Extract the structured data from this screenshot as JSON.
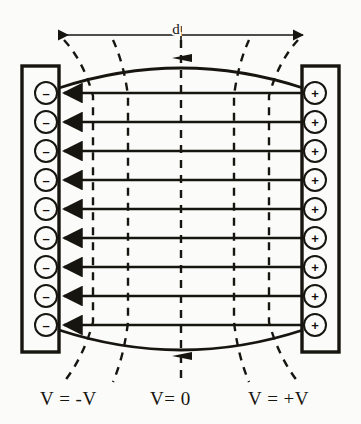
{
  "figure": {
    "background_color": "#fbfbf9",
    "ink_color": "#17150f"
  },
  "dimension": {
    "label": "d",
    "style": "double-headed-arrow",
    "x_start": 57,
    "x_end": 305,
    "y": 35,
    "label_x": 181,
    "label_y": 30
  },
  "plates": {
    "left": {
      "name": "negative-plate",
      "charge_symbol": "–",
      "charge_count": 9,
      "x": 22,
      "y": 66,
      "width": 37,
      "height": 286,
      "potential_label": "V = -V"
    },
    "right": {
      "name": "positive-plate",
      "charge_symbol": "+",
      "charge_count": 9,
      "x": 302,
      "y": 66,
      "width": 37,
      "height": 286,
      "potential_label": "V = +V"
    }
  },
  "field_lines": {
    "count": 9,
    "direction": "right-to-left",
    "x_start": 303,
    "x_end": 58,
    "y_values": [
      93,
      122,
      151,
      180,
      209,
      238,
      267,
      296,
      325
    ]
  },
  "fringe_lines": [
    {
      "name": "top-fringe-line",
      "bulge": "up",
      "y_end": 93,
      "y_peak": 62
    },
    {
      "name": "bottom-fringe-line",
      "bulge": "down",
      "y_end": 325,
      "y_peak": 356
    }
  ],
  "equipotentials": {
    "count": 5,
    "style": "dashed",
    "x_values": [
      93,
      128,
      181,
      234,
      269
    ],
    "top_y": 40,
    "bottom_y": 380
  },
  "labels": [
    {
      "name": "potential-label-negative",
      "text": "V = -V",
      "x": 40,
      "y": 404
    },
    {
      "name": "potential-label-zero",
      "text": "V= 0",
      "x": 150,
      "y": 404
    },
    {
      "name": "potential-label-positive",
      "text": "V = +V",
      "x": 250,
      "y": 404
    }
  ],
  "charge_rows_y": [
    93,
    122,
    151,
    180,
    209,
    238,
    267,
    296,
    325
  ],
  "charge_symbols": {
    "negative": "–",
    "positive": "+"
  }
}
